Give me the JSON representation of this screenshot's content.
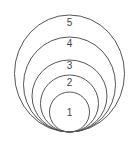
{
  "diagram": {
    "type": "nested-tangent-circles",
    "stroke_color": "#555555",
    "label_color": "#444444",
    "background": "#ffffff",
    "tangent_point": {
      "x": 69,
      "y": 132
    },
    "circles": [
      {
        "label": "1",
        "cx": 69.5,
        "cy": 112,
        "rx": 20,
        "ry": 20,
        "label_y": 116
      },
      {
        "label": "2",
        "cx": 69.5,
        "cy": 103.5,
        "rx": 29,
        "ry": 28.5,
        "label_y": 86
      },
      {
        "label": "3",
        "cx": 69.5,
        "cy": 96,
        "rx": 37.5,
        "ry": 36,
        "label_y": 69
      },
      {
        "label": "4",
        "cx": 69.5,
        "cy": 84.5,
        "rx": 46,
        "ry": 47.5,
        "label_y": 47
      },
      {
        "label": "5",
        "cx": 69.5,
        "cy": 73.5,
        "rx": 55,
        "ry": 58.5,
        "label_y": 26
      }
    ]
  }
}
